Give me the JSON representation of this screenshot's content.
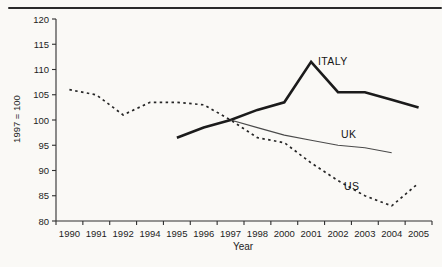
{
  "page": {
    "background": "#faf9f6",
    "top_rule_color": "#2a2a2a",
    "axis_color": "#2f2f2f",
    "text_color": "#1d1d1d"
  },
  "chart_data": {
    "type": "line",
    "title": "",
    "xlabel": "Year",
    "ylabel": "1997 = 100",
    "ylim": [
      80,
      120
    ],
    "yticks": [
      80,
      85,
      90,
      95,
      100,
      105,
      110,
      115,
      120
    ],
    "grid": false,
    "legend": "inline-labels",
    "categories": [
      "1990",
      "1991",
      "1992",
      "1994",
      "1995",
      "1996",
      "1997",
      "1998",
      "2000",
      "2001",
      "2002",
      "2003",
      "2004",
      "2005"
    ],
    "series": [
      {
        "name": "ITALY",
        "style": "solid-thick",
        "color": "#1b1b1b",
        "values": [
          null,
          null,
          null,
          null,
          96.5,
          98.5,
          100,
          102,
          103.5,
          111.5,
          105.5,
          105.5,
          104,
          102.5
        ]
      },
      {
        "name": "UK",
        "style": "solid-thin",
        "color": "#4a4a4a",
        "values": [
          null,
          null,
          null,
          null,
          null,
          null,
          100,
          98.5,
          97,
          96,
          95,
          94.5,
          93.5,
          null
        ]
      },
      {
        "name": "US",
        "style": "dashed",
        "color": "#262626",
        "values": [
          106,
          105,
          101,
          103.5,
          103.5,
          103,
          100,
          96.5,
          95.5,
          91.5,
          88,
          85,
          83,
          87.5
        ]
      }
    ]
  }
}
